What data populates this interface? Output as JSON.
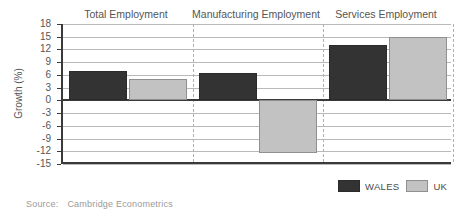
{
  "chart_data": {
    "type": "bar",
    "title": "",
    "xlabel": "",
    "ylabel": "Growth (%)",
    "ylim": [
      -15,
      18
    ],
    "ytick_step": 3,
    "yticks": [
      18,
      15,
      12,
      9,
      6,
      3,
      0,
      -3,
      -6,
      -9,
      -12,
      -15
    ],
    "grid": true,
    "legend_position": "bottom-right",
    "categories": [
      "Total Employment",
      "Manufacturing Employment",
      "Services Employment"
    ],
    "series": [
      {
        "name": "WALES",
        "color": "#333333",
        "values": [
          7,
          6.5,
          13
        ]
      },
      {
        "name": "UK",
        "color": "#c2c2c2",
        "values": [
          5,
          -12.5,
          15
        ]
      }
    ],
    "source_label": "Source:",
    "source_text": "Cambridge Econometrics"
  },
  "legend": {
    "items": [
      {
        "label": "WALES",
        "color": "#333333"
      },
      {
        "label": "UK",
        "color": "#c2c2c2"
      }
    ]
  },
  "axis": {
    "y_title": "Growth (%)"
  },
  "footer": {
    "source_label": "Source:",
    "source_text": "Cambridge Econometrics"
  }
}
